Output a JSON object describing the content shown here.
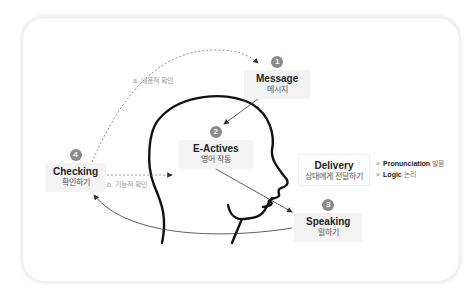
{
  "diagram": {
    "nodes": {
      "message": {
        "step": "1",
        "title": "Message",
        "subtitle": "메시지"
      },
      "e_actives": {
        "step": "2",
        "title": "E-Actives",
        "subtitle": "영어 작동"
      },
      "speaking": {
        "step": "3",
        "title": "Speaking",
        "subtitle": "말하기"
      },
      "checking": {
        "step": "4",
        "title": "Checking",
        "subtitle": "확인하기"
      }
    },
    "delivery": {
      "title": "Delivery",
      "subtitle": "상대에게 전달하기",
      "criteria": [
        {
          "marker": "×",
          "label": "Pronunciation",
          "label_kr": "발음"
        },
        {
          "marker": "×",
          "label": "Logic",
          "label_kr": "논리"
        }
      ]
    },
    "edges": {
      "a_label": "a. 내용적 확인",
      "b_label": "b. 기능적 확인"
    },
    "colors": {
      "badge": "#8a8a8a",
      "node_bg": "#f3f3f3",
      "head_stroke": "#111111",
      "dashed": "#777777"
    }
  }
}
